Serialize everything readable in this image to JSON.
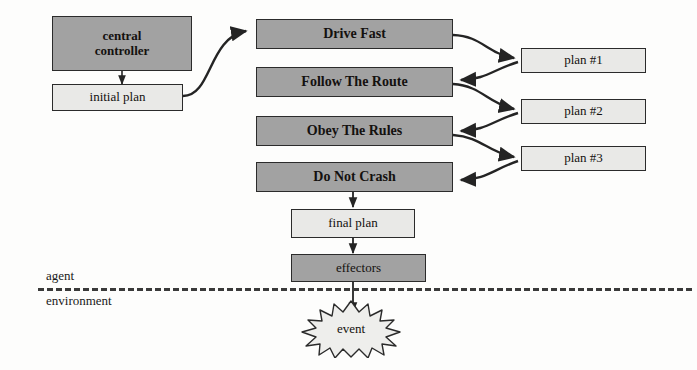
{
  "diagram": {
    "colors": {
      "dark_fill": "#a2a2a2",
      "light_fill": "#e9e9e7",
      "stroke": "#2b2b2b",
      "background": "#fdfdfc"
    },
    "boundary": {
      "above_label": "agent",
      "below_label": "environment"
    },
    "nodes": {
      "central_controller": "central\ncontroller",
      "initial_plan": "initial plan",
      "drive_fast": "Drive Fast",
      "follow_the_route": "Follow The Route",
      "obey_the_rules": "Obey The Rules",
      "do_not_crash": "Do Not Crash",
      "plan_1": "plan #1",
      "plan_2": "plan #2",
      "plan_3": "plan #3",
      "final_plan": "final plan",
      "effectors": "effectors",
      "event": "event"
    },
    "edges": [
      {
        "name": "controller-to-initial-plan",
        "from": "central_controller",
        "to": "initial_plan"
      },
      {
        "name": "initial-plan-to-drive-fast",
        "from": "initial_plan",
        "to": "drive_fast"
      },
      {
        "name": "drive-fast-to-plan-1",
        "from": "drive_fast",
        "to": "plan_1"
      },
      {
        "name": "plan-1-to-follow-the-route",
        "from": "plan_1",
        "to": "follow_the_route"
      },
      {
        "name": "follow-the-route-to-plan-2",
        "from": "follow_the_route",
        "to": "plan_2"
      },
      {
        "name": "plan-2-to-obey-the-rules",
        "from": "plan_2",
        "to": "obey_the_rules"
      },
      {
        "name": "obey-the-rules-to-plan-3",
        "from": "obey_the_rules",
        "to": "plan_3"
      },
      {
        "name": "plan-3-to-do-not-crash",
        "from": "plan_3",
        "to": "do_not_crash"
      },
      {
        "name": "do-not-crash-to-final-plan",
        "from": "do_not_crash",
        "to": "final_plan"
      },
      {
        "name": "final-plan-to-effectors",
        "from": "final_plan",
        "to": "effectors"
      },
      {
        "name": "effectors-to-event",
        "from": "effectors",
        "to": "event"
      }
    ]
  }
}
